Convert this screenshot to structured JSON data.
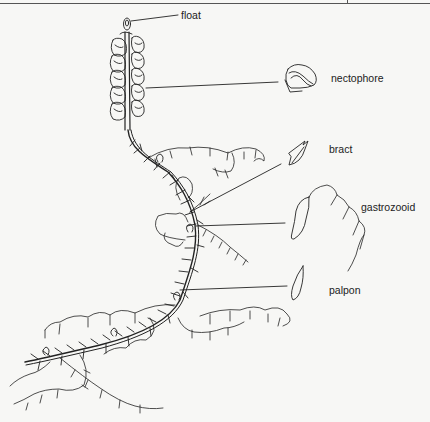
{
  "diagram": {
    "labels": {
      "float": "float",
      "nectophore": "nectophore",
      "bract": "bract",
      "gastrozooid": "gastrozooid",
      "palpon": "palpon"
    },
    "colors": {
      "background": "#f7f7f5",
      "ink": "#222222"
    }
  }
}
